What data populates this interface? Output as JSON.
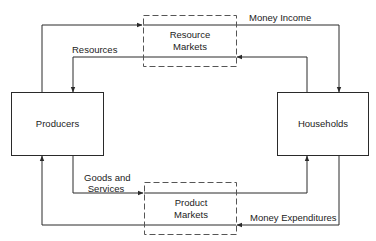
{
  "diagram": {
    "type": "circular-flow",
    "nodes": {
      "producers": {
        "label": "Producers"
      },
      "households": {
        "label": "Households"
      },
      "resource_markets": {
        "line1": "Resource",
        "line2": "Markets"
      },
      "product_markets": {
        "line1": "Product",
        "line2": "Markets"
      }
    },
    "flows": {
      "money_income": {
        "label": "Money Income"
      },
      "resources": {
        "label": "Resources"
      },
      "goods_and_services": {
        "line1": "Goods and",
        "line2": "Services"
      },
      "money_expenditures": {
        "label": "Money Expenditures"
      }
    },
    "colors": {
      "line": "#2a2a2a",
      "dashed_border": "#555555",
      "background": "#ffffff"
    }
  }
}
